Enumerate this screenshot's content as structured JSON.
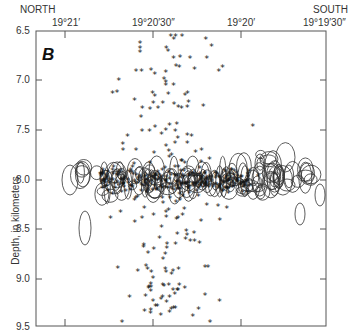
{
  "chart_data": {
    "type": "scatter",
    "title": "",
    "panel_label": "B",
    "orientation_labels": {
      "left": "NORTH",
      "right": "SOUTH"
    },
    "xlabel": "Latitude",
    "ylabel": "Depth, in kilometers",
    "x_ticks": [
      "19°21′",
      "19°20′30″",
      "19°20′",
      "19°19′30″"
    ],
    "y_ticks": [
      "6.5",
      "7.0",
      "7.5",
      "8.0",
      "8.5",
      "9.0",
      "9.5"
    ],
    "ylim": [
      9.5,
      6.5
    ],
    "y_inverted": true,
    "grid": false,
    "series": [
      {
        "name": "Earthquake hypocenters (asterisks)",
        "marker": "asterisk",
        "description": "Scattered vertical cloud centered near 19°20′30″–19°20′15″, depth 6.6–9.5 km, densest near 8.0 km"
      },
      {
        "name": "Error ellipses (open ellipses)",
        "marker": "ellipse",
        "description": "Horizontal band of location-error ellipses at ~7.8–8.3 km depth spanning ~19°20′50″ to 19°19′30″"
      }
    ]
  },
  "labels": {
    "north": "NORTH",
    "south": "SOUTH",
    "panel": "B",
    "y_axis": "Depth, in kilometers",
    "x_ticks": [
      "19°21′",
      "19°20′30″",
      "19°20′",
      "19°19′30″"
    ],
    "y_ticks": [
      "6.5",
      "7.0",
      "7.5",
      "8.0",
      "8.5",
      "9.0",
      "9.5"
    ]
  }
}
